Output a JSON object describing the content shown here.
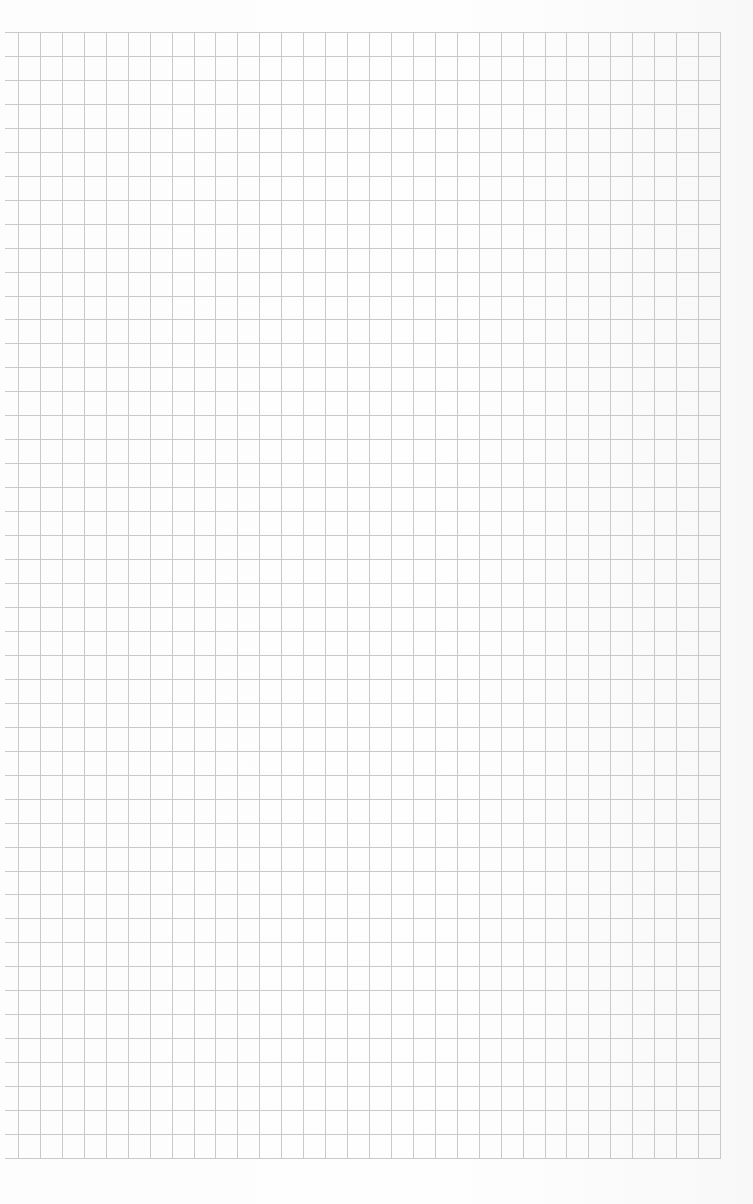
{
  "page": {
    "type": "graph-paper-sheet",
    "width": 753,
    "height": 1204,
    "background_color": "#fcfcfc"
  },
  "grid": {
    "line_color": "#c9c9c9",
    "line_width": 1,
    "top": 32,
    "bottom": 1158,
    "left_vertical": 18,
    "right_vertical": 720,
    "horizontal_line_left_start": 5,
    "columns": 32,
    "rows": 47
  }
}
